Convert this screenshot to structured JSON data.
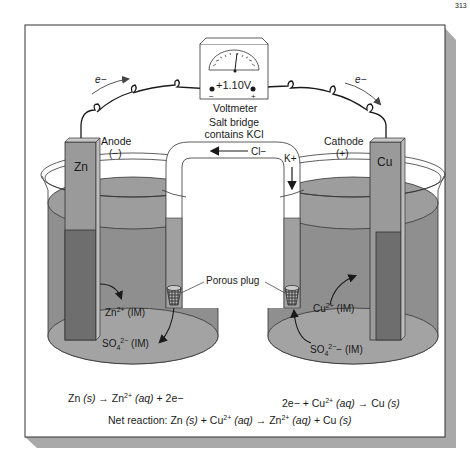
{
  "page_number_fragment": "313",
  "voltmeter": {
    "reading": "+1.10V",
    "label": "Voltmeter",
    "negative_terminal": "−",
    "positive_terminal": "+"
  },
  "electron_flow": {
    "left_label": "e−",
    "right_label": "e−"
  },
  "salt_bridge": {
    "label_line1": "Salt bridge",
    "label_line2": "contains KCl",
    "anion_label": "Cl−",
    "cation_label": "K+"
  },
  "anode": {
    "title": "Anode",
    "sign": "(−)",
    "metal": "Zn",
    "cation": "Zn",
    "cation_charge": "2+",
    "cation_conc": " (IM)",
    "anion": "SO",
    "anion_sub": "4",
    "anion_charge": "2−",
    "anion_conc": " (IM)"
  },
  "cathode": {
    "title": "Cathode",
    "sign": "(+)",
    "metal": "Cu",
    "cation": "Cu",
    "cation_charge": "2+",
    "cation_conc": " (IM)",
    "anion": "SO",
    "anion_sub": "4",
    "anion_charge": "2−",
    "anion_conc": "− (IM)"
  },
  "porous_plug_label": "Porous plug",
  "equations": {
    "anode_half": {
      "p1": "Zn ",
      "p2": "(s)",
      "p3": " → Zn",
      "sup": "2+",
      "p4": " ",
      "p5": "(aq)",
      "p6": " + 2e−"
    },
    "cathode_half": {
      "p1": "2e− + Cu",
      "sup": "2+",
      "p2": " ",
      "p3": "(aq)",
      "p4": " → Cu ",
      "p5": "(s)"
    },
    "net": {
      "prefix": "Net reaction: Zn ",
      "s1": "(s)",
      "m1": " + Cu",
      "sup1": "2+",
      "sp1": " ",
      "aq1": "(aq)",
      "m2": " → Zn",
      "sup2": "2+",
      "sp2": " ",
      "aq2": "(aq)",
      "m3": " + Cu ",
      "s2": "(s)"
    }
  },
  "colors": {
    "frame_border": "#333333",
    "shadow": "#a9a9a9",
    "solution": "#8f8f8f",
    "solution_top": "#9d9d9d",
    "solution_bottom": "#a5a5a5",
    "electrode": "#9a9a9a",
    "electrode_dark": "#6e6e6e",
    "ink": "#1a1a1a"
  }
}
